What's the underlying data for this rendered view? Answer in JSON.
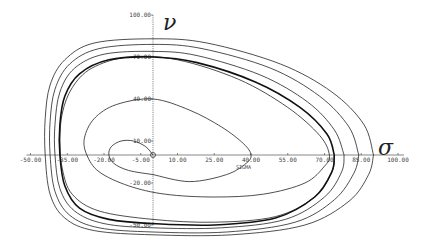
{
  "chart_data": {
    "type": "line",
    "title": "",
    "xlabel": "SIGMA",
    "x_symbol": "σ",
    "ylabel": "",
    "y_symbol": "ν",
    "xlim": [
      -50,
      100
    ],
    "ylim": [
      -50,
      100
    ],
    "x_ticks": [
      -50,
      -35,
      -20,
      -5,
      10,
      25,
      40,
      55,
      70,
      85,
      100
    ],
    "x_tick_labels": [
      "-50.00",
      "-35.00",
      "-20.00",
      "-5.00",
      "10.00",
      "25.00",
      "40.00",
      "55.00",
      "70.00",
      "85.00",
      "100.00"
    ],
    "y_ticks": [
      100,
      70,
      40,
      10,
      -20,
      -50
    ],
    "y_tick_labels": [
      "100.00",
      "70.00",
      "40.00",
      "10.00",
      "-20.00",
      "-50.00"
    ],
    "grid": false,
    "legend": "none",
    "series": [
      {
        "name": "trajectory-inner-spiral",
        "bold": false,
        "points": [
          [
            0,
            0
          ],
          [
            -3,
            6
          ],
          [
            -8,
            10
          ],
          [
            -13,
            10
          ],
          [
            -17,
            6
          ],
          [
            -18,
            0
          ],
          [
            -16,
            -6
          ],
          [
            -10,
            -11
          ],
          [
            0,
            -14
          ]
        ]
      },
      {
        "name": "trajectory-mid-loop",
        "bold": false,
        "points": [
          [
            0,
            -14
          ],
          [
            15,
            -19
          ],
          [
            30,
            -14
          ],
          [
            38,
            -6
          ],
          [
            40,
            0
          ],
          [
            37,
            8
          ],
          [
            28,
            20
          ],
          [
            15,
            32
          ],
          [
            0,
            40
          ],
          [
            -15,
            36
          ],
          [
            -24,
            26
          ],
          [
            -28,
            12
          ],
          [
            -27,
            0
          ],
          [
            -22,
            -12
          ],
          [
            -10,
            -22
          ],
          [
            5,
            -28
          ],
          [
            25,
            -30
          ],
          [
            45,
            -28
          ],
          [
            62,
            -20
          ],
          [
            70,
            -8
          ],
          [
            72,
            0
          ],
          [
            68,
            14
          ],
          [
            55,
            34
          ],
          [
            35,
            54
          ],
          [
            10,
            68
          ],
          [
            -10,
            70
          ],
          [
            -25,
            62
          ],
          [
            -33,
            48
          ],
          [
            -37,
            30
          ],
          [
            -38,
            10
          ],
          [
            -37,
            -10
          ],
          [
            -33,
            -28
          ],
          [
            -22,
            -40
          ],
          [
            0,
            -46
          ],
          [
            25,
            -48
          ],
          [
            50,
            -44
          ],
          [
            66,
            -30
          ],
          [
            73,
            -12
          ],
          [
            74,
            0
          ]
        ]
      },
      {
        "name": "limit-cycle",
        "bold": true,
        "points": [
          [
            74,
            0
          ],
          [
            71,
            15
          ],
          [
            60,
            34
          ],
          [
            42,
            52
          ],
          [
            18,
            66
          ],
          [
            0,
            70
          ],
          [
            -18,
            68
          ],
          [
            -30,
            58
          ],
          [
            -36,
            42
          ],
          [
            -38,
            22
          ],
          [
            -38,
            0
          ],
          [
            -36,
            -22
          ],
          [
            -30,
            -38
          ],
          [
            -18,
            -46
          ],
          [
            0,
            -49
          ],
          [
            25,
            -50
          ],
          [
            50,
            -45
          ],
          [
            66,
            -30
          ],
          [
            73,
            -12
          ],
          [
            74,
            0
          ]
        ]
      },
      {
        "name": "trajectory-outer-1",
        "bold": false,
        "points": [
          [
            78,
            0
          ],
          [
            74,
            18
          ],
          [
            63,
            38
          ],
          [
            44,
            57
          ],
          [
            18,
            71
          ],
          [
            0,
            74
          ],
          [
            -20,
            72
          ],
          [
            -32,
            62
          ],
          [
            -38,
            45
          ],
          [
            -40,
            22
          ],
          [
            -40,
            0
          ],
          [
            -38,
            -24
          ],
          [
            -32,
            -40
          ],
          [
            -20,
            -49
          ],
          [
            0,
            -52
          ],
          [
            28,
            -52
          ],
          [
            54,
            -46
          ],
          [
            70,
            -30
          ],
          [
            77,
            -12
          ],
          [
            78,
            0
          ]
        ]
      },
      {
        "name": "trajectory-outer-2",
        "bold": false,
        "points": [
          [
            84,
            0
          ],
          [
            80,
            20
          ],
          [
            68,
            42
          ],
          [
            48,
            62
          ],
          [
            20,
            76
          ],
          [
            0,
            79
          ],
          [
            -22,
            76
          ],
          [
            -34,
            65
          ],
          [
            -40,
            47
          ],
          [
            -42,
            24
          ],
          [
            -42,
            0
          ],
          [
            -40,
            -26
          ],
          [
            -34,
            -43
          ],
          [
            -22,
            -52
          ],
          [
            0,
            -55
          ],
          [
            30,
            -55
          ],
          [
            58,
            -48
          ],
          [
            74,
            -32
          ],
          [
            82,
            -13
          ],
          [
            84,
            0
          ]
        ]
      },
      {
        "name": "trajectory-outer-3",
        "bold": false,
        "points": [
          [
            90,
            0
          ],
          [
            86,
            22
          ],
          [
            73,
            45
          ],
          [
            52,
            65
          ],
          [
            22,
            80
          ],
          [
            0,
            83
          ],
          [
            -24,
            80
          ],
          [
            -36,
            68
          ],
          [
            -42,
            50
          ],
          [
            -44,
            26
          ],
          [
            -44,
            0
          ],
          [
            -42,
            -28
          ],
          [
            -36,
            -45
          ],
          [
            -24,
            -54
          ],
          [
            0,
            -57
          ],
          [
            32,
            -57
          ],
          [
            62,
            -50
          ],
          [
            80,
            -33
          ],
          [
            88,
            -14
          ],
          [
            90,
            0
          ]
        ]
      }
    ]
  }
}
